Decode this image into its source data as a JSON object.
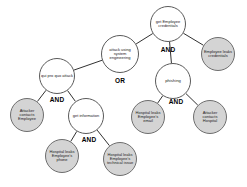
{
  "diagram": {
    "type": "attack-tree",
    "background_color": "#ffffff",
    "internal_node_fill": "#ffffff",
    "leaf_node_fill": "#d4d4d4",
    "node_stroke": "#5a5a5a",
    "edge_color": "#1a1a1a",
    "nodes": [
      {
        "id": "root",
        "label": "attack using system engineering",
        "kind": "internal",
        "cx": 120,
        "cy": 54,
        "r": 19,
        "font_size": 4.0
      },
      {
        "id": "quid_pro_quo",
        "label": "qui pro quo attack",
        "kind": "internal",
        "cx": 57,
        "cy": 76,
        "r": 18,
        "font_size": 4.0
      },
      {
        "id": "get_employee_credentials",
        "label": "get Employee credentials",
        "kind": "internal",
        "cx": 168,
        "cy": 24,
        "r": 18,
        "font_size": 4.0
      },
      {
        "id": "phishing",
        "label": "phishing",
        "kind": "internal",
        "cx": 173,
        "cy": 81,
        "r": 18,
        "font_size": 4.2
      },
      {
        "id": "get_information",
        "label": "get information",
        "kind": "internal",
        "cx": 86,
        "cy": 116,
        "r": 18,
        "font_size": 4.0
      },
      {
        "id": "employee_leaks_credentials",
        "label": "Employee leaks credentials",
        "kind": "leaf",
        "cx": 218,
        "cy": 54,
        "r": 17,
        "font_size": 4.0
      },
      {
        "id": "attacker_contacts_employee",
        "label": "Attacker contacts Employee",
        "kind": "leaf",
        "cx": 27,
        "cy": 115,
        "r": 17,
        "font_size": 4.0
      },
      {
        "id": "hospital_leaks_employees_email",
        "label": "Hospital leaks Employee's email",
        "kind": "leaf",
        "cx": 148,
        "cy": 117,
        "r": 17,
        "font_size": 4.0
      },
      {
        "id": "attacker_contacts_hospital",
        "label": "Attacker contacts Hospital",
        "kind": "leaf",
        "cx": 210,
        "cy": 117,
        "r": 17,
        "font_size": 4.0
      },
      {
        "id": "hospital_leaks_employees_phone",
        "label": "Hospital leaks Employee's phone",
        "kind": "leaf",
        "cx": 62,
        "cy": 156,
        "r": 17,
        "font_size": 4.0
      },
      {
        "id": "hospital_leaks_employees_technical_issue",
        "label": "Hospital leaks Employee's technical issue",
        "kind": "leaf",
        "cx": 120,
        "cy": 159,
        "r": 17,
        "font_size": 4.0
      }
    ],
    "gates": [
      {
        "id": "gate-root",
        "label": "OR",
        "x": 120,
        "y": 80,
        "font_size": 6.5,
        "parent": "root"
      },
      {
        "id": "gate-credentials",
        "label": "AND",
        "x": 168,
        "y": 49,
        "font_size": 6.5,
        "parent": "get_employee_credentials"
      },
      {
        "id": "gate-quid",
        "label": "AND",
        "x": 57,
        "y": 99,
        "font_size": 6.5,
        "parent": "quid_pro_quo"
      },
      {
        "id": "gate-phishing",
        "label": "AND",
        "x": 176,
        "y": 101,
        "font_size": 6.5,
        "parent": "phishing"
      },
      {
        "id": "gate-information",
        "label": "AND",
        "x": 89,
        "y": 139,
        "font_size": 6.5,
        "parent": "get_information"
      }
    ],
    "edges": [
      {
        "id": "edge-root-quid",
        "from": "root",
        "to": "quid_pro_quo"
      },
      {
        "id": "edge-root-credentials",
        "from": "root",
        "to": "get_employee_credentials"
      },
      {
        "id": "edge-credentials-phishing",
        "from": "get_employee_credentials",
        "to": "phishing"
      },
      {
        "id": "edge-credentials-leaks",
        "from": "get_employee_credentials",
        "to": "employee_leaks_credentials"
      },
      {
        "id": "edge-quid-contacts-employee",
        "from": "quid_pro_quo",
        "to": "attacker_contacts_employee"
      },
      {
        "id": "edge-quid-get-information",
        "from": "quid_pro_quo",
        "to": "get_information"
      },
      {
        "id": "edge-phishing-email",
        "from": "phishing",
        "to": "hospital_leaks_employees_email"
      },
      {
        "id": "edge-phishing-contacts-hospital",
        "from": "phishing",
        "to": "attacker_contacts_hospital"
      },
      {
        "id": "edge-information-phone",
        "from": "get_information",
        "to": "hospital_leaks_employees_phone"
      },
      {
        "id": "edge-information-technical",
        "from": "get_information",
        "to": "hospital_leaks_employees_technical_issue"
      }
    ]
  }
}
